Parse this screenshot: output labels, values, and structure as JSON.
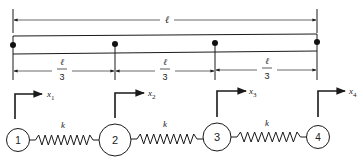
{
  "diagram": {
    "total_length_label": "ℓ",
    "segment_label": {
      "numerator": "ℓ",
      "denominator": "3"
    },
    "segments": 3,
    "spring_label": "k",
    "masses": [
      {
        "id": "1",
        "displacement": "x",
        "subscript": "1"
      },
      {
        "id": "2",
        "displacement": "x",
        "subscript": "2"
      },
      {
        "id": "3",
        "displacement": "x",
        "subscript": "3"
      },
      {
        "id": "4",
        "displacement": "x",
        "subscript": "4"
      }
    ],
    "springs": [
      {
        "label": "k"
      },
      {
        "label": "k"
      },
      {
        "label": "k"
      }
    ],
    "colors": {
      "ink": "#1a1a1a",
      "background": "#ffffff"
    }
  }
}
